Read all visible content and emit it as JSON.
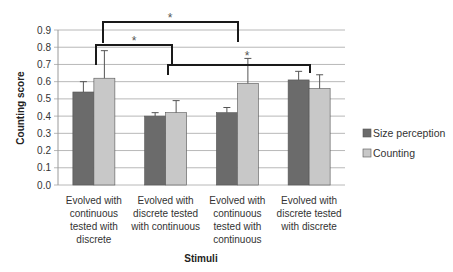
{
  "chart_data": {
    "type": "bar",
    "title": "",
    "xlabel": "Stimuli",
    "ylabel": "Counting score",
    "ylim": [
      0,
      0.9
    ],
    "yticks": [
      "0.0",
      "0.1",
      "0.2",
      "0.3",
      "0.4",
      "0.5",
      "0.6",
      "0.7",
      "0.8",
      "0.9"
    ],
    "grid": true,
    "legend_position": "right",
    "categories": [
      [
        "Evolved with",
        "continuous",
        "tested with",
        "discrete"
      ],
      [
        "Evolved with",
        "discrete tested",
        "with continuous"
      ],
      [
        "Evolved with",
        "continuous",
        "tested with",
        "continuous"
      ],
      [
        "Evolved with",
        "discrete tested",
        "with discrete"
      ]
    ],
    "series": [
      {
        "name": "Size perception",
        "color": "#6b6b6b",
        "values": [
          0.54,
          0.4,
          0.42,
          0.61
        ],
        "error_upper": [
          0.6,
          0.42,
          0.45,
          0.66
        ]
      },
      {
        "name": "Counting",
        "color": "#c8c8c8",
        "values": [
          0.62,
          0.42,
          0.59,
          0.56
        ],
        "error_upper": [
          0.78,
          0.49,
          0.735,
          0.64
        ]
      }
    ],
    "annotations": [
      {
        "type": "significance",
        "label": "*",
        "between": [
          "Counting: Evolved with continuous tested with discrete",
          "Counting: Evolved with continuous tested with continuous"
        ]
      },
      {
        "type": "significance",
        "label": "*",
        "between": [
          "Evolved with continuous tested with discrete",
          "Evolved with discrete tested with continuous"
        ]
      },
      {
        "type": "significance",
        "label": "*",
        "between": [
          "Evolved with discrete tested with continuous",
          "Evolved with discrete tested with discrete"
        ]
      }
    ]
  },
  "legend": {
    "items": [
      {
        "label": "Size perception",
        "color": "#6b6b6b"
      },
      {
        "label": "Counting",
        "color": "#c8c8c8"
      }
    ]
  },
  "significance_mark": "*"
}
